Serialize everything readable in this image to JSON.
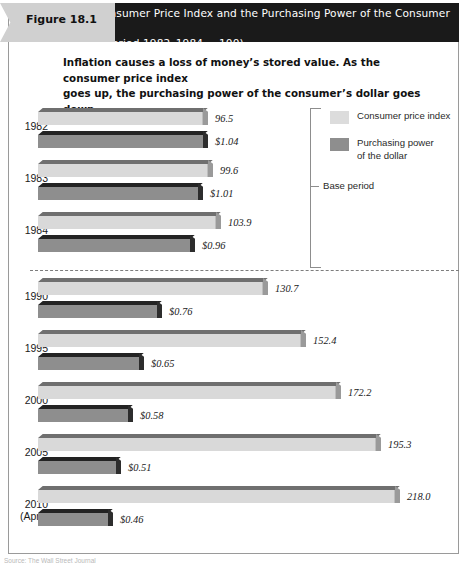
{
  "figure": {
    "tab_label": "Figure 18.1",
    "title_line1": "The Consumer Price Index and the Purchasing Power of the Consumer Dollar",
    "title_line2": "(Base Period 1982–1984 = 100)",
    "subtitle_line1": "Inflation causes a loss of money’s stored value. As the consumer price index",
    "subtitle_line2": "goes up, the purchasing power of the consumer’s dollar goes down.",
    "source_note": "Source: The Wall Street Journal"
  },
  "legend": {
    "items": [
      {
        "swatch": "light",
        "line1": "Consumer price index",
        "line2": ""
      },
      {
        "swatch": "dark",
        "line1": "Purchasing power",
        "line2": "of the dollar"
      }
    ]
  },
  "annotations": {
    "base_period_label": "Base period"
  },
  "colors": {
    "cpi_bar": "#d9d9d9",
    "power_bar": "#8e8e8e",
    "header_bar": "#1a1a1a",
    "tab": "#d0d0d0"
  },
  "chart_data": {
    "type": "bar",
    "title": "The Consumer Price Index and the Purchasing Power of the Consumer Dollar",
    "subtitle": "(Base Period 1982–1984 = 100)",
    "orientation": "horizontal",
    "xlabel": "",
    "ylabel": "",
    "grid": false,
    "legend_position": "top-right",
    "categories": [
      "1982",
      "1983",
      "1984",
      "1990",
      "1995",
      "2000",
      "2005",
      "2010 (April)"
    ],
    "series": [
      {
        "name": "Consumer price index",
        "values": [
          96.5,
          99.6,
          103.9,
          130.7,
          152.4,
          172.2,
          195.3,
          218.0
        ],
        "labels": [
          "96.5",
          "99.6",
          "103.9",
          "130.7",
          "152.4",
          "172.2",
          "195.3",
          "218.0"
        ]
      },
      {
        "name": "Purchasing power of the dollar",
        "values": [
          1.04,
          1.01,
          0.96,
          0.76,
          0.65,
          0.58,
          0.51,
          0.46
        ],
        "labels": [
          "$1.04",
          "$1.01",
          "$0.96",
          "$0.76",
          "$0.65",
          "$0.58",
          "$0.51",
          "$0.46"
        ]
      }
    ],
    "annotations": [
      {
        "text": "Base period",
        "covers": [
          "1982",
          "1983",
          "1984"
        ]
      }
    ]
  },
  "rows": [
    {
      "year_line1": "1982",
      "year_line2": "",
      "cpi": "96.5",
      "power": "$1.04",
      "cpi_w": 170,
      "pow_w": 170,
      "y": 108
    },
    {
      "year_line1": "1983",
      "year_line2": "",
      "cpi": "99.6",
      "power": "$1.01",
      "cpi_w": 175,
      "pow_w": 165,
      "y": 160
    },
    {
      "year_line1": "1984",
      "year_line2": "",
      "cpi": "103.9",
      "power": "$0.96",
      "cpi_w": 183,
      "pow_w": 157,
      "y": 212
    },
    {
      "year_line1": "1990",
      "year_line2": "",
      "cpi": "130.7",
      "power": "$0.76",
      "cpi_w": 230,
      "pow_w": 124,
      "y": 278
    },
    {
      "year_line1": "1995",
      "year_line2": "",
      "cpi": "152.4",
      "power": "$0.65",
      "cpi_w": 268,
      "pow_w": 106,
      "y": 330
    },
    {
      "year_line1": "2000",
      "year_line2": "",
      "cpi": "172.2",
      "power": "$0.58",
      "cpi_w": 303,
      "pow_w": 95,
      "y": 382
    },
    {
      "year_line1": "2005",
      "year_line2": "",
      "cpi": "195.3",
      "power": "$0.51",
      "cpi_w": 343,
      "pow_w": 83,
      "y": 434
    },
    {
      "year_line1": "2010",
      "year_line2": "(April)",
      "cpi": "218.0",
      "power": "$0.46",
      "cpi_w": 362,
      "pow_w": 75,
      "y": 486
    }
  ]
}
